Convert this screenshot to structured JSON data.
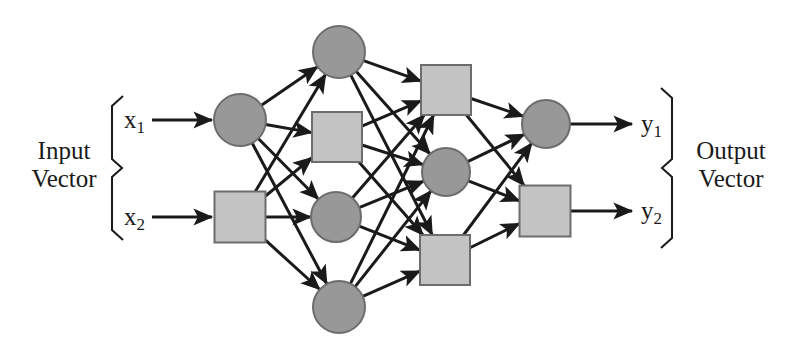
{
  "figure": {
    "type": "neural-network-diagram",
    "width": 793,
    "height": 347,
    "background": "#ffffff"
  },
  "labels": {
    "input_vector": "Input\nVector",
    "output_vector": "Output\nVector",
    "inputs": [
      {
        "id": "x1",
        "text": "x",
        "sub": "1"
      },
      {
        "id": "x2",
        "text": "x",
        "sub": "2"
      }
    ],
    "outputs": [
      {
        "id": "y1",
        "text": "y",
        "sub": "1"
      },
      {
        "id": "y2",
        "text": "y",
        "sub": "2"
      }
    ]
  },
  "colors": {
    "circle_fill": "#989898",
    "square_fill": "#c3c3c3",
    "node_stroke": "#6d6d6d",
    "edge": "#1a1a1a",
    "text": "#1a1a1a",
    "background": "#ffffff"
  },
  "chart_data": {
    "type": "diagram",
    "layers": [
      {
        "name": "input-layer",
        "index": 0,
        "nodes": [
          {
            "id": "i1",
            "shape": "circle",
            "cx": 240,
            "cy": 120,
            "r": 26
          },
          {
            "id": "i2",
            "shape": "square",
            "cx": 240,
            "cy": 217,
            "size": 51
          }
        ]
      },
      {
        "name": "hidden-layer-1",
        "index": 1,
        "nodes": [
          {
            "id": "h1",
            "shape": "circle",
            "cx": 339,
            "cy": 52,
            "r": 26
          },
          {
            "id": "h2",
            "shape": "square",
            "cx": 337,
            "cy": 137,
            "size": 50
          },
          {
            "id": "h3",
            "shape": "circle",
            "cx": 336,
            "cy": 217,
            "r": 25
          },
          {
            "id": "h4",
            "shape": "circle",
            "cx": 339,
            "cy": 307,
            "r": 26
          }
        ]
      },
      {
        "name": "hidden-layer-2",
        "index": 2,
        "nodes": [
          {
            "id": "g1",
            "shape": "square",
            "cx": 446,
            "cy": 90,
            "size": 50
          },
          {
            "id": "g2",
            "shape": "circle",
            "cx": 446,
            "cy": 172,
            "r": 24
          },
          {
            "id": "g3",
            "shape": "square",
            "cx": 445,
            "cy": 260,
            "size": 50
          }
        ]
      },
      {
        "name": "output-layer",
        "index": 3,
        "nodes": [
          {
            "id": "o1",
            "shape": "circle",
            "cx": 546,
            "cy": 124,
            "r": 24
          },
          {
            "id": "o2",
            "shape": "square",
            "cx": 545,
            "cy": 211,
            "size": 51
          }
        ]
      }
    ],
    "edges": [
      [
        "i1",
        "h1"
      ],
      [
        "i1",
        "h2"
      ],
      [
        "i1",
        "h3"
      ],
      [
        "i1",
        "h4"
      ],
      [
        "i2",
        "h1"
      ],
      [
        "i2",
        "h2"
      ],
      [
        "i2",
        "h3"
      ],
      [
        "i2",
        "h4"
      ],
      [
        "h1",
        "g1"
      ],
      [
        "h1",
        "g2"
      ],
      [
        "h1",
        "g3"
      ],
      [
        "h2",
        "g1"
      ],
      [
        "h2",
        "g2"
      ],
      [
        "h2",
        "g3"
      ],
      [
        "h3",
        "g1"
      ],
      [
        "h3",
        "g2"
      ],
      [
        "h3",
        "g3"
      ],
      [
        "h4",
        "g1"
      ],
      [
        "h4",
        "g2"
      ],
      [
        "h4",
        "g3"
      ],
      [
        "g1",
        "o1"
      ],
      [
        "g1",
        "o2"
      ],
      [
        "g2",
        "o1"
      ],
      [
        "g2",
        "o2"
      ],
      [
        "g3",
        "o1"
      ],
      [
        "g3",
        "o2"
      ]
    ],
    "input_arrows": [
      {
        "id": "in1",
        "x1": 152,
        "y1": 120,
        "x2": 212,
        "y2": 120
      },
      {
        "id": "in2",
        "x1": 152,
        "y1": 217,
        "x2": 212,
        "y2": 217
      }
    ],
    "output_arrows": [
      {
        "id": "out1",
        "x1": 570,
        "y1": 124,
        "x2": 632,
        "y2": 124
      },
      {
        "id": "out2",
        "x1": 571,
        "y1": 211,
        "x2": 632,
        "y2": 211
      }
    ],
    "braces": [
      {
        "id": "input-brace",
        "x": 112,
        "top": 96,
        "bottom": 240,
        "direction": "right"
      },
      {
        "id": "output-brace",
        "x": 672,
        "top": 88,
        "bottom": 248,
        "direction": "left"
      }
    ]
  }
}
